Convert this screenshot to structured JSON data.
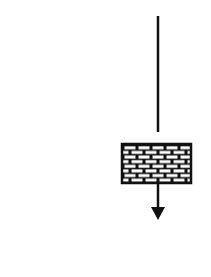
{
  "diagram": {
    "type": "schematic",
    "background": "#ffffff",
    "stroke_color": "#111111",
    "elements": [
      {
        "id": "vertical-line",
        "kind": "line",
        "x": 158,
        "y1": 16,
        "y2": 132
      },
      {
        "id": "brick-block",
        "kind": "hatched-rectangle",
        "pattern": "brick",
        "x": 122,
        "y": 144,
        "width": 69,
        "height": 39
      },
      {
        "id": "down-arrow",
        "kind": "arrow",
        "direction": "down",
        "x": 158,
        "y1": 183,
        "y2": 219
      }
    ]
  }
}
